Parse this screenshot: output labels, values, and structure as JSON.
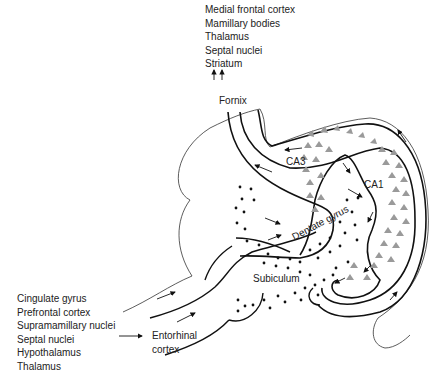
{
  "diagram": {
    "outputs_label": [
      "Medial frontal cortex",
      "Mamillary bodies",
      "Thalamus",
      "Septal nuclei",
      "Striatum"
    ],
    "fornix_label": "Fornix",
    "inputs_label": [
      "Cingulate gyrus",
      "Prefrontal cortex",
      "Supramamillary nuclei",
      "Septal nuclei",
      "Hypothalamus",
      "Thalamus"
    ],
    "entorhinal_label": [
      "Entorhinal",
      "cortex"
    ],
    "regions": {
      "ca3": "CA3",
      "ca1": "CA1",
      "dentate": "Dentate gyrus",
      "subiculum": "Subiculum"
    },
    "colors": {
      "line": "#111111",
      "thin_line": "#333333",
      "pyramidal_cells": "#9a9a9a",
      "granule_cells": "#111111"
    }
  }
}
